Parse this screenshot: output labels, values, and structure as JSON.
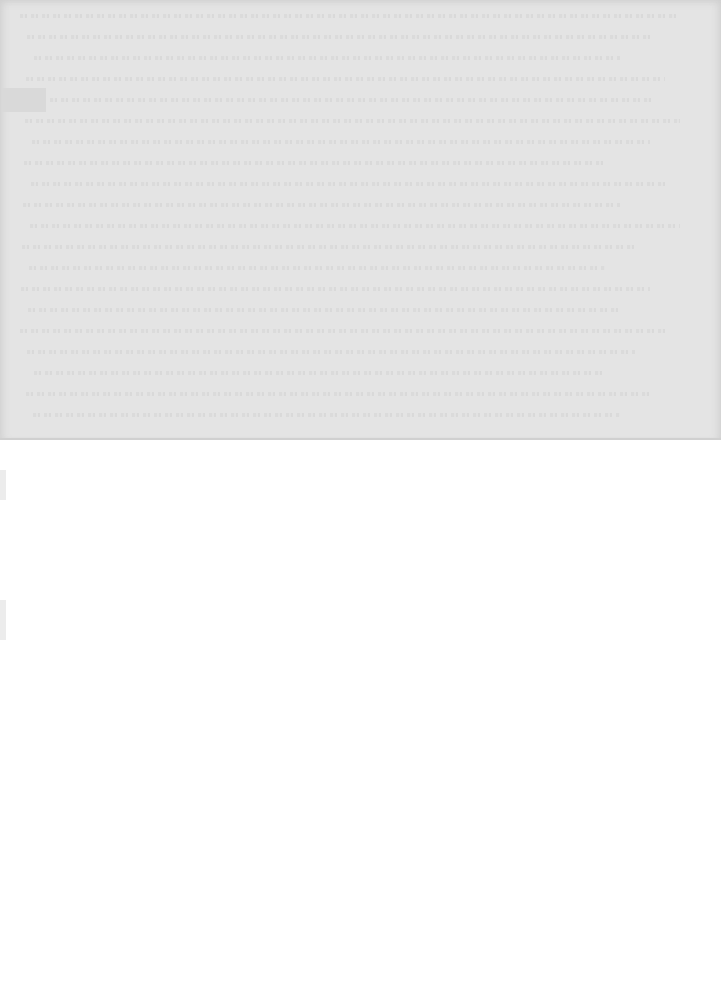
{
  "page": {
    "background": "#ffffff",
    "scan_band_color": "#e4e4e4",
    "scan_band_height_px": 440,
    "text_legible": false,
    "line_count": 20
  }
}
